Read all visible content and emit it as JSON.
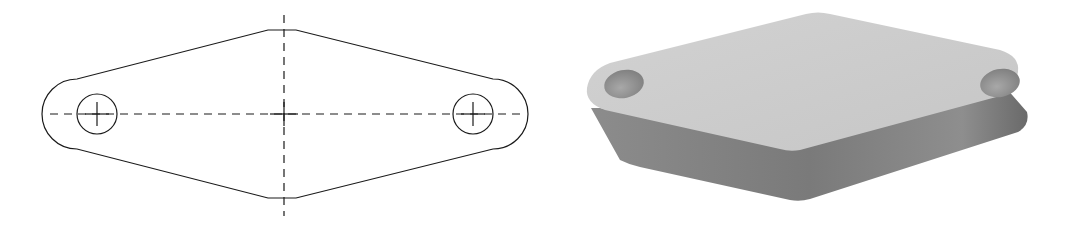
{
  "figure": {
    "views": [
      {
        "name": "orthographic-top-view",
        "description": "Diamond-shaped plate with rounded ends and two holes, dashed center lines"
      },
      {
        "name": "isometric-3d-view",
        "description": "Shaded 3D model of the same plate"
      }
    ],
    "colors": {
      "line": "#1a1a1a",
      "top_face": "#cdcdcd",
      "side_face": "#8a8a8a",
      "side_face_dark": "#6e6e6e",
      "hole": "#9a9a9a"
    }
  }
}
